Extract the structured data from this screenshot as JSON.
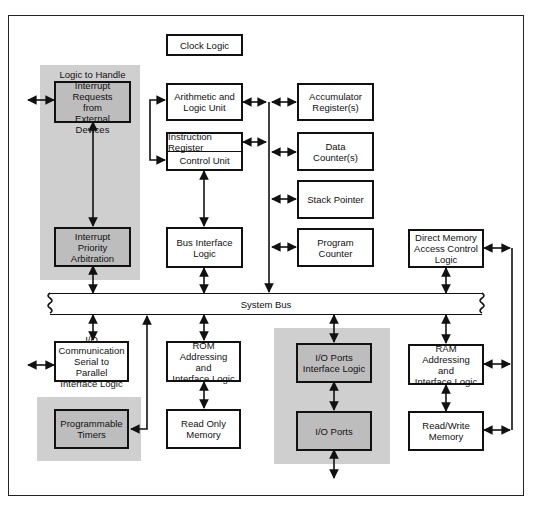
{
  "diagram": {
    "title_box": "Clock Logic",
    "system_bus": "System Bus",
    "interrupt_group": {
      "handler": "Logic to Handle\nInterrupt Requests\nfrom\nExternal Devices",
      "priority": "Interrupt Priority\nArbitration"
    },
    "cpu": {
      "alu": "Arithmetic and\nLogic Unit",
      "instruction_register": "Instruction Register",
      "control_unit": "Control Unit",
      "bus_interface": "Bus Interface\nLogic"
    },
    "registers": {
      "accumulator": "Accumulator\nRegister(s)",
      "data_counter": "Data Counter(s)",
      "stack_pointer": "Stack Pointer",
      "program_counter": "Program Counter"
    },
    "dma": "Direct Memory\nAccess Control\nLogic",
    "io_comm": "I/O Communication\nSerial to Parallel\nInterface Logic",
    "timers": "Programmable\nTimers",
    "rom_interface": "ROM Addressing\nand\nInterface Logic",
    "rom": "Read Only\nMemory",
    "io_ports_interface": "I/O Ports\nInterface Logic",
    "io_ports": "I/O Ports",
    "ram_interface": "RAM Addressing\nand\nInterface Logic",
    "ram": "Read/Write\nMemory"
  }
}
